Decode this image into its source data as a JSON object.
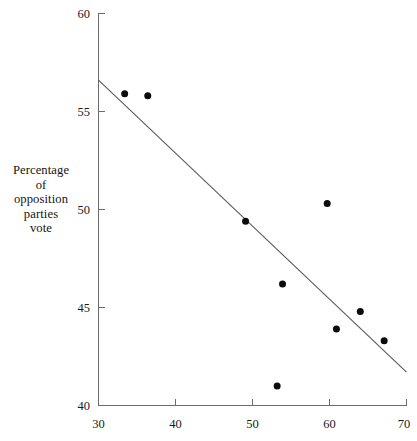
{
  "chart_data": {
    "type": "scatter",
    "title": "",
    "xlabel": "",
    "ylabel": "Percentage\nof\nopposition\nparties\nvote",
    "ylabel_lines": [
      "Percentage",
      "of",
      "opposition",
      "parties",
      "vote"
    ],
    "xlim": [
      30,
      70
    ],
    "ylim": [
      40,
      60
    ],
    "xticks": [
      30,
      40,
      50,
      60,
      70
    ],
    "yticks": [
      40,
      45,
      50,
      55,
      60
    ],
    "xtick_labels": [
      "30",
      "40",
      "50",
      "60",
      "70"
    ],
    "ytick_labels": [
      "40",
      "45",
      "50",
      "55",
      "60"
    ],
    "grid": false,
    "legend": false,
    "legend_position": "none",
    "marker": "filled-circle",
    "marker_color": "#0b0b0b",
    "marker_size_px": 7,
    "axis_color": "#6b6b6b",
    "line_color": "#555555",
    "points": [
      {
        "x": 33.4,
        "y": 55.9
      },
      {
        "x": 36.4,
        "y": 55.8
      },
      {
        "x": 49.1,
        "y": 49.4
      },
      {
        "x": 53.2,
        "y": 41.0
      },
      {
        "x": 53.9,
        "y": 46.2
      },
      {
        "x": 59.7,
        "y": 50.3
      },
      {
        "x": 60.9,
        "y": 43.9
      },
      {
        "x": 64.0,
        "y": 44.8
      },
      {
        "x": 67.1,
        "y": 43.3
      }
    ],
    "series": [
      {
        "name": "observations",
        "x": [
          33.4,
          36.4,
          49.1,
          53.2,
          53.9,
          59.7,
          60.9,
          64.0,
          67.1
        ],
        "values": [
          55.9,
          55.8,
          49.4,
          41.0,
          46.2,
          50.3,
          43.9,
          44.8,
          43.3
        ]
      }
    ],
    "fit_line": {
      "type": "linear-regression",
      "x_start": 30.0,
      "y_start": 56.6,
      "x_end": 70.0,
      "y_end": 41.7
    },
    "annotations": []
  }
}
